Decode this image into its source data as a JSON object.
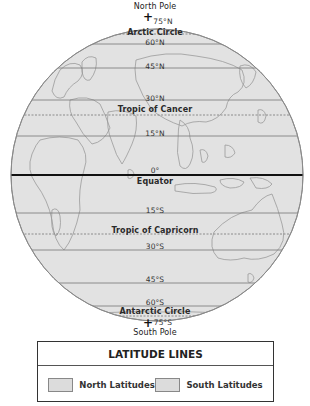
{
  "globe": {
    "fill_color": "#e2e2e2",
    "outline_color": "#8a8a8a",
    "line_color": "#777777",
    "equator_color": "#111111",
    "continent_color": "#9a9a9a",
    "north_pole_label": "North Pole",
    "south_pole_label": "South Pole",
    "pole_marker": "+",
    "latitudes": [
      {
        "id": "n75",
        "degree": "75°N",
        "y": 26,
        "style": "solid",
        "name": ""
      },
      {
        "id": "arctic",
        "degree": "",
        "y": 34,
        "style": "dashed",
        "name": "Arctic Circle"
      },
      {
        "id": "n60",
        "degree": "60°N",
        "y": 44,
        "style": "solid",
        "name": ""
      },
      {
        "id": "n45",
        "degree": "45°N",
        "y": 68,
        "style": "solid",
        "name": ""
      },
      {
        "id": "n30",
        "degree": "30°N",
        "y": 100,
        "style": "solid",
        "name": ""
      },
      {
        "id": "cancer",
        "degree": "",
        "y": 115,
        "style": "dashed",
        "name": "Tropic of Cancer"
      },
      {
        "id": "n15",
        "degree": "15°N",
        "y": 136,
        "style": "solid",
        "name": ""
      },
      {
        "id": "eq",
        "degree": "0°",
        "y": 175,
        "style": "bold",
        "name": "Equator"
      },
      {
        "id": "s15",
        "degree": "15°S",
        "y": 213,
        "style": "solid",
        "name": ""
      },
      {
        "id": "capricorn",
        "degree": "",
        "y": 234,
        "style": "dashed",
        "name": "Tropic of Capricorn"
      },
      {
        "id": "s30",
        "degree": "30°S",
        "y": 250,
        "style": "solid",
        "name": ""
      },
      {
        "id": "s45",
        "degree": "45°S",
        "y": 283,
        "style": "solid",
        "name": ""
      },
      {
        "id": "s60",
        "degree": "60°S",
        "y": 306,
        "style": "solid",
        "name": ""
      },
      {
        "id": "antarctic",
        "degree": "",
        "y": 316,
        "style": "dashed",
        "name": "Antarctic Circle"
      },
      {
        "id": "s75",
        "degree": "75°S",
        "y": 323,
        "style": "solid",
        "name": ""
      }
    ],
    "labels": {
      "n75": "75°N",
      "arctic": "Arctic Circle",
      "n60": "60°N",
      "n45": "45°N",
      "n30": "30°N",
      "cancer": "Tropic of Cancer",
      "n15": "15°N",
      "eq_deg": "0°",
      "eq_name": "Equator",
      "s15": "15°S",
      "capricorn": "Tropic of Capricorn",
      "s30": "30°S",
      "s45": "45°S",
      "s60": "60°S",
      "antarctic": "Antarctic Circle",
      "s75": "75°S"
    }
  },
  "legend": {
    "title": "LATITUDE LINES",
    "items": [
      {
        "label": "North Latitudes",
        "color": "#dcdcdc"
      },
      {
        "label": "South Latitudes",
        "color": "#dcdcdc"
      }
    ]
  }
}
